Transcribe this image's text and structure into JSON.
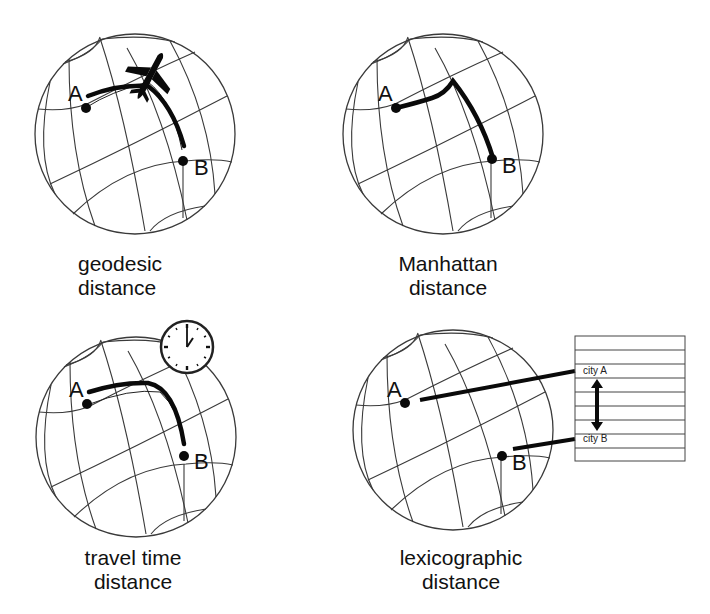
{
  "figure": {
    "panels": [
      {
        "id": "geodesic",
        "caption_line1": "geodesic",
        "caption_line2": "distance",
        "point_a": "A",
        "point_b": "B",
        "icon": "airplane-icon"
      },
      {
        "id": "manhattan",
        "caption_line1": "Manhattan",
        "caption_line2": "distance",
        "point_a": "A",
        "point_b": "B"
      },
      {
        "id": "travel-time",
        "caption_line1": "travel time",
        "caption_line2": "distance",
        "point_a": "A",
        "point_b": "B",
        "icon": "clock-icon"
      },
      {
        "id": "lexicographic",
        "caption_line1": "lexicographic",
        "caption_line2": "distance",
        "point_a": "A",
        "point_b": "B",
        "table": {
          "city_a": "city A",
          "city_b": "city B"
        }
      }
    ]
  }
}
